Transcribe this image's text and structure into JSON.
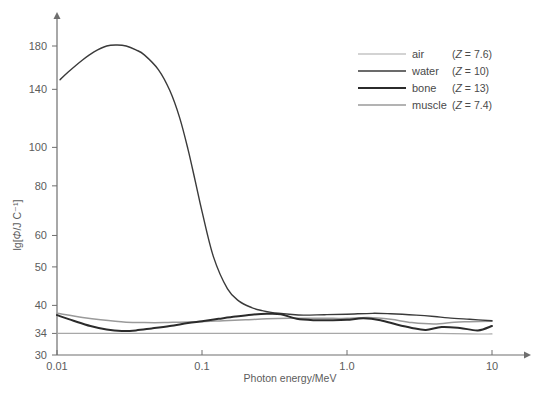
{
  "chart_data": {
    "type": "line",
    "title": "",
    "xlabel": "Photon energy/MeV",
    "ylabel": "lg[Φ/J C⁻¹]",
    "xscale": "log",
    "yscale": "log",
    "xlim": [
      0.01,
      10
    ],
    "ylim": [
      30,
      190
    ],
    "grid": false,
    "legend_position": "top-right",
    "xticks": [
      "0.01",
      "0.1",
      "1.0",
      "10"
    ],
    "xtick_values": [
      0.01,
      0.1,
      1.0,
      10
    ],
    "yticks": [
      "30",
      "34",
      "40",
      "50",
      "60",
      "80",
      "100",
      "140",
      "180"
    ],
    "ytick_values": [
      30,
      34,
      40,
      50,
      60,
      80,
      100,
      140,
      180
    ],
    "series": [
      {
        "name": "air",
        "legend_label": "air",
        "z_label": "(Z = 7.6)",
        "z_value": 7.6,
        "color": "#a8a8a8",
        "width": 1.1,
        "x": [
          0.01,
          0.02,
          0.04,
          0.07,
          0.1,
          0.2,
          0.4,
          0.7,
          1.0,
          2.0,
          4.0,
          7.0,
          10.0
        ],
        "y": [
          34.0,
          34.0,
          34.0,
          34.0,
          34.0,
          34.0,
          34.0,
          34.0,
          34.0,
          34.0,
          34.0,
          33.9,
          33.9
        ]
      },
      {
        "name": "water",
        "legend_label": "water",
        "z_label": "(Z = 10)",
        "z_value": 10,
        "color": "#3a3a3a",
        "width": 1.4,
        "x": [
          0.0105,
          0.012,
          0.015,
          0.018,
          0.022,
          0.026,
          0.03,
          0.035,
          0.04,
          0.05,
          0.06,
          0.07,
          0.08,
          0.09,
          0.1,
          0.12,
          0.15,
          0.18,
          0.22,
          0.26,
          0.3,
          0.4,
          0.5,
          0.7,
          1.0,
          1.5,
          2.0,
          3.0,
          4.0,
          5.0,
          7.0,
          10.0
        ],
        "y": [
          148,
          155,
          166,
          174,
          180,
          181,
          180,
          176,
          171,
          157,
          139,
          119,
          99,
          82,
          69,
          53,
          44,
          41,
          39.5,
          38.8,
          38.4,
          38.0,
          37.8,
          37.9,
          38.0,
          38.2,
          38.1,
          37.8,
          37.5,
          37.2,
          36.9,
          36.6
        ]
      },
      {
        "name": "bone",
        "legend_label": "bone",
        "z_label": "(Z = 13)",
        "z_value": 13,
        "color": "#2b2b2b",
        "width": 2.0,
        "x": [
          0.01,
          0.013,
          0.017,
          0.022,
          0.028,
          0.035,
          0.045,
          0.06,
          0.08,
          0.1,
          0.13,
          0.17,
          0.22,
          0.28,
          0.35,
          0.45,
          0.6,
          0.8,
          1.0,
          1.3,
          1.7,
          2.2,
          2.8,
          3.5,
          4.5,
          6.0,
          8.0,
          10.0
        ],
        "y": [
          37.8,
          36.6,
          35.5,
          34.8,
          34.5,
          34.6,
          35.0,
          35.5,
          36.1,
          36.5,
          37.0,
          37.5,
          37.9,
          38.1,
          38.0,
          37.0,
          36.7,
          36.7,
          36.8,
          37.1,
          36.7,
          35.8,
          35.1,
          34.7,
          35.3,
          35.1,
          34.6,
          35.5
        ]
      },
      {
        "name": "muscle",
        "legend_label": "muscle",
        "z_label": "(Z = 7.4)",
        "z_value": 7.4,
        "color": "#9a9a9a",
        "width": 1.5,
        "x": [
          0.01,
          0.015,
          0.02,
          0.03,
          0.04,
          0.055,
          0.07,
          0.1,
          0.14,
          0.2,
          0.28,
          0.4,
          0.55,
          0.8,
          1.0,
          1.4,
          2.0,
          2.8,
          4.0,
          5.5,
          7.0,
          10.0
        ],
        "y": [
          38.2,
          37.3,
          36.8,
          36.3,
          36.2,
          36.2,
          36.3,
          36.4,
          36.6,
          36.8,
          37.0,
          37.1,
          37.1,
          37.1,
          37.1,
          37.3,
          36.9,
          36.2,
          35.9,
          36.3,
          36.4,
          36.5
        ]
      }
    ]
  },
  "axes": {
    "x_title": "Photon energy/MeV",
    "y_title_prefix": "lg[",
    "y_title_symbol": "Φ",
    "y_title_suffix": "/J C⁻¹]"
  },
  "legend": {
    "rows": [
      {
        "label": "air",
        "z": "(Z = 7.6)"
      },
      {
        "label": "water",
        "z": "(Z = 10)"
      },
      {
        "label": "bone",
        "z": "(Z = 13)"
      },
      {
        "label": "muscle",
        "z": "(Z = 7.4)"
      }
    ]
  },
  "colors": {
    "air": "#a8a8a8",
    "water": "#3a3a3a",
    "bone": "#2b2b2b",
    "muscle": "#9a9a9a",
    "axis": "#6e6e6e",
    "text": "#5c5c5c",
    "background": "#ffffff"
  }
}
